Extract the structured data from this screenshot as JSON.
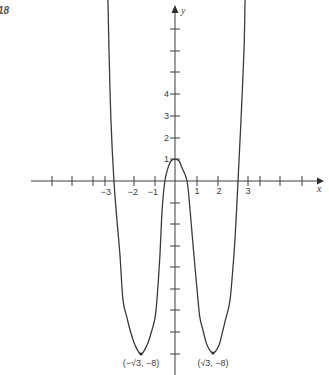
{
  "figure": {
    "number": "18"
  },
  "chart_data": {
    "type": "line",
    "title": "",
    "xlabel": "x",
    "ylabel": "y",
    "x_tick_labels": [
      "−3",
      "−2",
      "−1",
      "1",
      "2",
      "3"
    ],
    "y_tick_labels": [
      "1",
      "2",
      "3",
      "4"
    ],
    "xlim": [
      -6.7,
      6.88
    ],
    "ylim": [
      -9.02,
      8.09
    ],
    "grid": false,
    "legend": null,
    "annotations": [
      {
        "text": "(−√3, −8)",
        "x": -1.732,
        "y": -8
      },
      {
        "text": "(√3, −8)",
        "x": 1.732,
        "y": -8
      }
    ],
    "extrema": [
      {
        "x": -1.732,
        "y": -8
      },
      {
        "x": 0,
        "y": 1
      },
      {
        "x": 1.732,
        "y": -8
      }
    ],
    "series": [
      {
        "name": "curve",
        "points": [
          [
            -3.16,
            8.9
          ],
          [
            -3.12,
            8.42
          ],
          [
            -3.07,
            6.09
          ],
          [
            -2.98,
            2.84
          ],
          [
            -2.84,
            0
          ],
          [
            -2.7,
            -1.81
          ],
          [
            -2.56,
            -3.44
          ],
          [
            -2.42,
            -5.53
          ],
          [
            -2.23,
            -6.37
          ],
          [
            -2.09,
            -6.93
          ],
          [
            -1.86,
            -7.63
          ],
          [
            -1.58,
            -8.05
          ],
          [
            -1.3,
            -7.63
          ],
          [
            -1.07,
            -6.93
          ],
          [
            -0.93,
            -6.37
          ],
          [
            -0.84,
            -5.53
          ],
          [
            -0.7,
            -3.44
          ],
          [
            -0.6,
            -1.35
          ],
          [
            -0.47,
            0
          ],
          [
            -0.33,
            0.6
          ],
          [
            -0.19,
            0.93
          ],
          [
            0,
            1.02
          ],
          [
            0.19,
            0.93
          ],
          [
            0.33,
            0.6
          ],
          [
            0.56,
            0
          ],
          [
            0.7,
            -1.35
          ],
          [
            0.88,
            -3.44
          ],
          [
            1.07,
            -5.53
          ],
          [
            1.16,
            -6.37
          ],
          [
            1.3,
            -6.93
          ],
          [
            1.49,
            -7.63
          ],
          [
            1.77,
            -8.0
          ],
          [
            2.05,
            -7.63
          ],
          [
            2.23,
            -6.93
          ],
          [
            2.37,
            -6.37
          ],
          [
            2.56,
            -5.53
          ],
          [
            2.74,
            -3.44
          ],
          [
            2.84,
            -1.81
          ],
          [
            2.93,
            0
          ],
          [
            3.07,
            2.84
          ],
          [
            3.21,
            6.09
          ],
          [
            3.26,
            8.42
          ],
          [
            3.3,
            8.9
          ]
        ]
      }
    ]
  },
  "plot_geometry": {
    "origin_px": [
      175,
      181
    ],
    "unit_px": 21.5,
    "x_axis_px": [
      31,
      318
    ],
    "y_axis_px": [
      12,
      375
    ],
    "x_tick_px": [
      52,
      72,
      93,
      105,
      134,
      155,
      197,
      218,
      248,
      260,
      280,
      302
    ],
    "y_tick_px": [
      29,
      51,
      72,
      94,
      116,
      138,
      159,
      203,
      224,
      246,
      267,
      289,
      310,
      332,
      354
    ],
    "tick_half_len": 5,
    "marker_px": [
      [
        141,
        354
      ],
      [
        213,
        353
      ]
    ]
  },
  "colors": {
    "line": "#3a3a3a",
    "text": "#3c3c3c",
    "background": "#ffffff"
  }
}
